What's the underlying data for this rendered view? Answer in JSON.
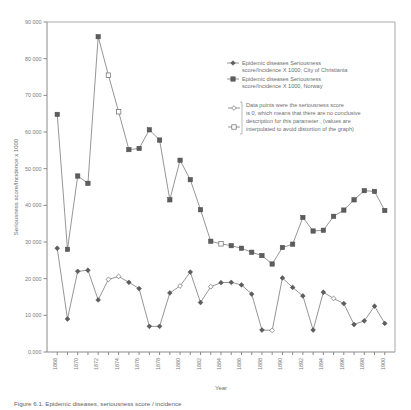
{
  "chart_data": {
    "type": "line",
    "title": "",
    "xlabel": "Year",
    "ylabel": "Seriousness score/Incidence x 1000",
    "xlim": [
      1867,
      1901
    ],
    "ylim": [
      0,
      90000
    ],
    "grid": false,
    "legend_position": "inside-right",
    "x_tick_labels": [
      "1868",
      "1870",
      "1872",
      "1874",
      "1876",
      "1878",
      "1880",
      "1882",
      "1884",
      "1886",
      "1888",
      "1890",
      "1892",
      "1894",
      "1896",
      "1898",
      "1900"
    ],
    "y_tick_labels": [
      "0,000",
      "10 000",
      "20 000",
      "30 000",
      "40 000",
      "50 000",
      "60 000",
      "70 000",
      "80 000",
      "90 000"
    ],
    "y_tick_values": [
      0,
      10000,
      20000,
      30000,
      40000,
      50000,
      60000,
      70000,
      80000,
      90000
    ],
    "x": [
      1868,
      1869,
      1870,
      1871,
      1872,
      1873,
      1874,
      1875,
      1876,
      1877,
      1878,
      1879,
      1880,
      1881,
      1882,
      1883,
      1884,
      1885,
      1886,
      1887,
      1888,
      1889,
      1890,
      1891,
      1892,
      1893,
      1894,
      1895,
      1896,
      1897,
      1898,
      1899,
      1900
    ],
    "series": [
      {
        "name": "Epidemic diseases Seriousness score/Incidence X 1000, Norway",
        "marker": "square",
        "values": [
          64800,
          28000,
          48000,
          46000,
          86000,
          75500,
          65500,
          55200,
          55500,
          60600,
          57800,
          41500,
          52300,
          47000,
          38800,
          30200,
          29500,
          29000,
          28300,
          27200,
          26300,
          24000,
          28500,
          29400,
          36700,
          33000,
          33200,
          37000,
          38700,
          41500,
          44000,
          43800,
          38600
        ],
        "open_marker_indices": [
          5,
          6,
          16
        ]
      },
      {
        "name": "Epidemic diseases Seriousness score/Incidence X 1000, City of Christiania",
        "marker": "diamond",
        "values": [
          28300,
          9000,
          22000,
          22300,
          14200,
          19800,
          20600,
          19000,
          17300,
          7000,
          7000,
          16100,
          18000,
          21800,
          13500,
          17800,
          18900,
          19000,
          18300,
          15800,
          6000,
          5900,
          20200,
          17600,
          15300,
          6000,
          16300,
          14600,
          13200,
          7500,
          8500,
          12500,
          7800
        ],
        "open_marker_indices": [
          5,
          6,
          12,
          15,
          21,
          27
        ]
      }
    ]
  },
  "legend": {
    "entries": [
      {
        "marker": "diamond-filled",
        "line1": "Epidemic diseases Seriousness",
        "line2": "score/Incidence X 1000; City of Christiania"
      },
      {
        "marker": "square-filled",
        "line1": "Epidemic diseases Seriousness",
        "line2": "score/Incidence X 1000, Norway"
      }
    ],
    "note": {
      "marker_top": "diamond-open",
      "marker_bottom": "square-open",
      "lines": [
        "Data points were the seriousness score",
        "is 0, which means that there are no conclusive",
        "description for this parameter , (values are",
        "interpolated to avoid distortion of the graph)"
      ]
    }
  },
  "caption": {
    "text": "Figure 6.1. Epidemic diseases, seriousness score / incidence"
  },
  "colors": {
    "marker": "#5d5d5d",
    "line": "#7b7b7b",
    "axis": "#8a8a8a",
    "text": "#6e6e6e"
  }
}
